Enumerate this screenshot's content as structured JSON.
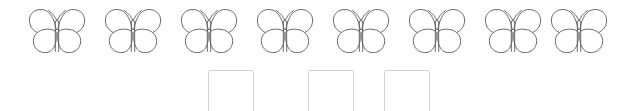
{
  "worksheet": {
    "type": "counting-addition-exercise",
    "background_color": "#ffffff",
    "object_row": {
      "icon_name": "butterfly-icon",
      "count": 8,
      "outline_color": "#5a5a5a",
      "fill_color": "#ffffff",
      "items": [
        {
          "index": 1,
          "label": "butterfly"
        },
        {
          "index": 2,
          "label": "butterfly"
        },
        {
          "index": 3,
          "label": "butterfly"
        },
        {
          "index": 4,
          "label": "butterfly"
        },
        {
          "index": 5,
          "label": "butterfly"
        },
        {
          "index": 6,
          "label": "butterfly"
        },
        {
          "index": 7,
          "label": "butterfly"
        },
        {
          "index": 8,
          "label": "butterfly"
        }
      ]
    },
    "equation": {
      "addend1": {
        "value": "",
        "placeholder": ""
      },
      "operator_add": "add",
      "addend2": {
        "value": "",
        "placeholder": ""
      },
      "operator_equals": "=",
      "sum": {
        "value": "",
        "placeholder": ""
      },
      "box_border_color": "#d2d2d2",
      "text_color": "#55565a"
    }
  }
}
